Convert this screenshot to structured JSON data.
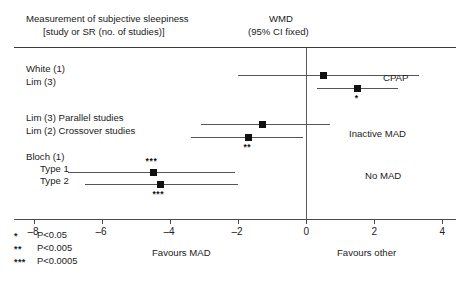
{
  "header": {
    "left_line1": "Measurement of subjective sleepiness",
    "left_line2": "[study or SR (no. of studies)]",
    "right_line1": "WMD",
    "right_line2": "(95% CI fixed)"
  },
  "axis": {
    "ticks": [
      -8,
      -6,
      -4,
      -2,
      0,
      2,
      4
    ],
    "tick_labels": [
      "–8",
      "–6",
      "–4",
      "–2",
      "0",
      "2",
      "4"
    ],
    "min": -8.6,
    "max": 4.4,
    "zero": 0,
    "favours_left": "Favours MAD",
    "favours_right": "Favours other"
  },
  "legend": [
    {
      "mark": "*",
      "text_prefix": "P",
      "text": "P<0.05"
    },
    {
      "mark": "**",
      "text_prefix": "P",
      "text": "P<0.005"
    },
    {
      "mark": "***",
      "text_prefix": "P",
      "text": "P<0.0005"
    }
  ],
  "comparisons": [
    {
      "name": "CPAP",
      "label": "CPAP"
    },
    {
      "name": "Inactive MAD",
      "label": "Inactive MAD"
    },
    {
      "name": "No MAD",
      "label": "No MAD"
    }
  ],
  "chart_data": {
    "type": "forest",
    "title": "Measurement of subjective sleepiness",
    "xlabel": "WMD (95% CI fixed)",
    "ylabel": "",
    "xlim": [
      -8.6,
      4.4
    ],
    "grid": false,
    "null_line": 0,
    "effect_measure": "WMD (95% CI fixed)",
    "rows": [
      {
        "label": "White (1)",
        "group": "CPAP",
        "estimate": 0.5,
        "ci_low": -2.0,
        "ci_high": 3.3,
        "significance": "",
        "star_position": ""
      },
      {
        "label": "Lim (3)",
        "group": "CPAP",
        "estimate": 1.5,
        "ci_low": 0.3,
        "ci_high": 2.7,
        "significance": "*",
        "star_position": "below"
      },
      {
        "label": "Lim (3) Parallel studies",
        "group": "Inactive MAD",
        "estimate": -1.3,
        "ci_low": -3.1,
        "ci_high": 0.7,
        "significance": "",
        "star_position": ""
      },
      {
        "label": "Lim (2) Crossover studies",
        "group": "Inactive MAD",
        "estimate": -1.7,
        "ci_low": -3.4,
        "ci_high": -0.1,
        "significance": "**",
        "star_position": "below"
      },
      {
        "label": "Bloch (1)",
        "group": "No MAD",
        "estimate": null,
        "ci_low": null,
        "ci_high": null,
        "significance": "",
        "star_position": ""
      },
      {
        "label": "Type 1",
        "group": "No MAD",
        "estimate": -4.5,
        "ci_low": -7.0,
        "ci_high": -2.1,
        "significance": "***",
        "star_position": "above"
      },
      {
        "label": "Type 2",
        "group": "No MAD",
        "estimate": -4.3,
        "ci_low": -6.5,
        "ci_high": -2.0,
        "significance": "***",
        "star_position": "below"
      }
    ]
  }
}
